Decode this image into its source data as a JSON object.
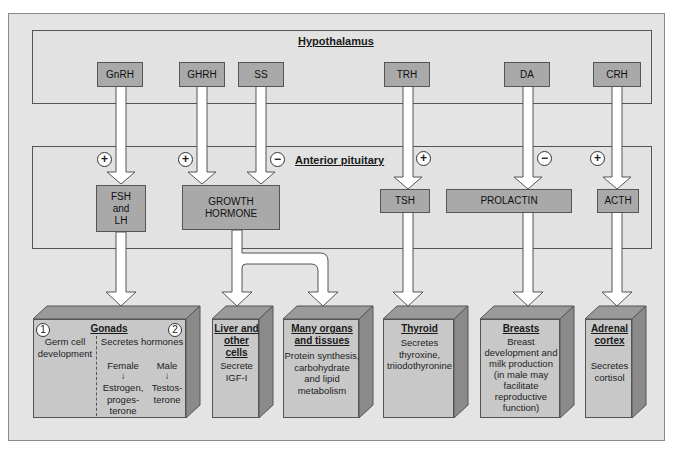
{
  "hypothalamus": {
    "title": "Hypothalamus",
    "hormones": [
      "GnRH",
      "GHRH",
      "SS",
      "TRH",
      "DA",
      "CRH"
    ]
  },
  "anterior_pituitary": {
    "title": "Anterior pituitary",
    "signs": [
      "+",
      "+",
      "−",
      "+",
      "−",
      "+"
    ],
    "hormones": {
      "fsh_lh": [
        "FSH",
        "and",
        "LH"
      ],
      "gh": [
        "GROWTH",
        "HORMONE"
      ],
      "tsh": "TSH",
      "prolactin": "PROLACTIN",
      "acth": "ACTH"
    }
  },
  "targets": {
    "gonads": {
      "title": "Gonads",
      "num1": "1",
      "num2": "2",
      "left": [
        "Germ cell",
        "development"
      ],
      "right_title": "Secretes hormones",
      "female": "Female",
      "male": "Male",
      "female_products": [
        "Estrogen,",
        "proges-",
        "terone"
      ],
      "male_products": [
        "Testos-",
        "terone"
      ]
    },
    "liver": {
      "title": [
        "Liver and",
        "other cells"
      ],
      "text": [
        "Secrete",
        "IGF-I"
      ]
    },
    "organs": {
      "title": [
        "Many organs",
        "and tissues"
      ],
      "text": [
        "Protein synthesis,",
        "carbohydrate",
        "and lipid",
        "metabolism"
      ]
    },
    "thyroid": {
      "title": "Thyroid",
      "text": [
        "Secretes",
        "thyroxine,",
        "triiodothyronine"
      ]
    },
    "breasts": {
      "title": "Breasts",
      "text": [
        "Breast",
        "development and",
        "milk production",
        "(in male may",
        "facilitate",
        "reproductive",
        "function)"
      ]
    },
    "adrenal": {
      "title": [
        "Adrenal",
        "cortex"
      ],
      "text": [
        "Secretes",
        "cortisol"
      ]
    }
  },
  "colors": {
    "background": "#e4e4e4",
    "hormone_box": "#a9a9a9",
    "organ_front": "#c8c8c8",
    "organ_top": "#9a9a9a",
    "organ_side": "#8a8a8a",
    "arrow_fill": "#ffffff"
  }
}
